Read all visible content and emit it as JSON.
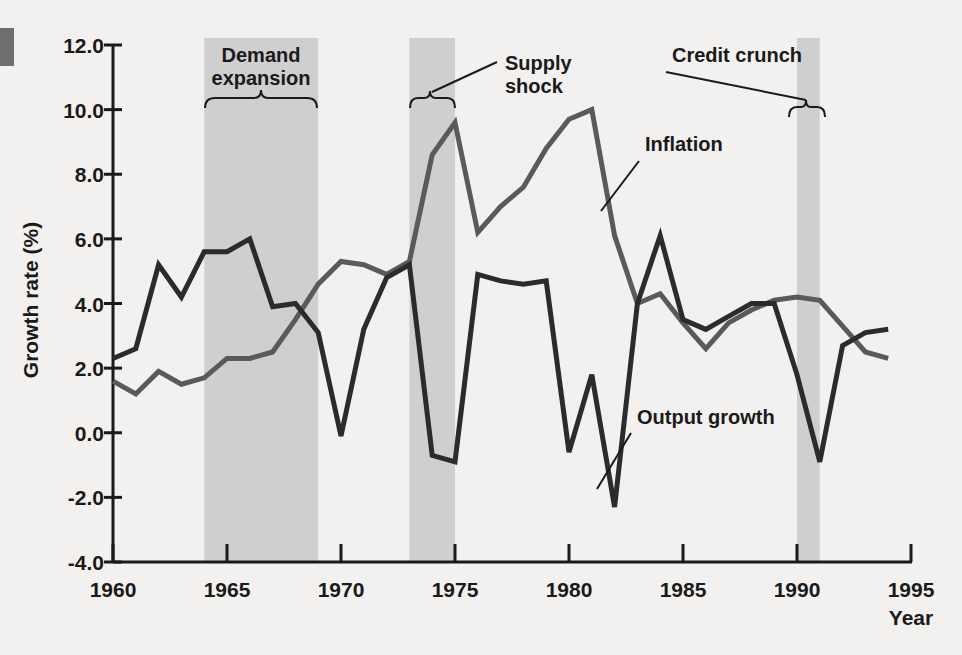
{
  "figure": {
    "margin_mark": "left-edge-bar",
    "background_color": "#f2f1ef",
    "band_color": "#cfcfcf",
    "axis_color": "#1a1a1a"
  },
  "chart_data": {
    "type": "line",
    "title": "",
    "xlabel": "Year",
    "ylabel": "Growth rate (%)",
    "xlim": [
      1960,
      1995
    ],
    "ylim": [
      -4.0,
      12.0
    ],
    "grid": false,
    "legend": "inline-annotations",
    "xticks": [
      "1960",
      "1965",
      "1970",
      "1975",
      "1980",
      "1985",
      "1990",
      "1995"
    ],
    "yticks": [
      "12.0",
      "10.0",
      "8.0",
      "6.0",
      "4.0",
      "2.0",
      "0.0",
      "-2.0",
      "-4.0"
    ],
    "x": [
      1960,
      1961,
      1962,
      1963,
      1964,
      1965,
      1966,
      1967,
      1968,
      1969,
      1970,
      1971,
      1972,
      1973,
      1974,
      1975,
      1976,
      1977,
      1978,
      1979,
      1980,
      1981,
      1982,
      1983,
      1984,
      1985,
      1986,
      1987,
      1988,
      1989,
      1990,
      1991,
      1992,
      1993,
      1994
    ],
    "series": [
      {
        "name": "Output growth",
        "color": "#2b2b2b",
        "width": 5,
        "values": [
          2.3,
          2.6,
          5.2,
          4.2,
          5.6,
          5.6,
          6.0,
          3.9,
          4.0,
          3.1,
          -0.1,
          3.2,
          4.8,
          5.2,
          -0.7,
          -0.9,
          4.9,
          4.7,
          4.6,
          4.7,
          -0.6,
          1.8,
          -2.3,
          4.0,
          6.1,
          3.5,
          3.2,
          3.6,
          4.0,
          4.0,
          1.8,
          -0.9,
          2.7,
          3.1,
          3.2
        ]
      },
      {
        "name": "Inflation",
        "color": "#5a5a5a",
        "width": 5,
        "values": [
          1.6,
          1.2,
          1.9,
          1.5,
          1.7,
          2.3,
          2.3,
          2.5,
          3.5,
          4.6,
          5.3,
          5.2,
          4.9,
          5.3,
          8.6,
          9.6,
          6.2,
          7.0,
          7.6,
          8.8,
          9.7,
          10.0,
          6.1,
          4.0,
          4.3,
          3.4,
          2.6,
          3.4,
          3.8,
          4.1,
          4.2,
          4.1,
          3.3,
          2.5,
          2.3
        ]
      }
    ],
    "annotations": [
      {
        "name": "Demand expansion",
        "label_lines": [
          "Demand",
          "expansion"
        ],
        "brace_span": [
          1964,
          1969
        ]
      },
      {
        "name": "Supply shock",
        "label_lines": [
          "Supply",
          "shock"
        ],
        "brace_span": [
          1973,
          1975
        ]
      },
      {
        "name": "Credit crunch",
        "label_lines": [
          "Credit crunch"
        ],
        "brace_span": [
          1990,
          1991
        ]
      },
      {
        "name": "Inflation",
        "label_lines": [
          "Inflation"
        ],
        "points_to": 1981
      },
      {
        "name": "Output growth",
        "label_lines": [
          "Output growth"
        ],
        "points_to": 1982
      }
    ],
    "shaded_bands": [
      {
        "name": "demand-expansion-band",
        "from": 1964,
        "to": 1969
      },
      {
        "name": "supply-shock-band",
        "from": 1973,
        "to": 1975
      },
      {
        "name": "credit-crunch-band",
        "from": 1990,
        "to": 1991
      }
    ]
  },
  "labels": {
    "ylabel": "Growth rate (%)",
    "xlabel": "Year",
    "demand_l1": "Demand",
    "demand_l2": "expansion",
    "supply_l1": "Supply",
    "supply_l2": "shock",
    "credit": "Credit crunch",
    "inflation": "Inflation",
    "output": "Output growth",
    "y12": "12.0",
    "y10": "10.0",
    "y8": "8.0",
    "y6": "6.0",
    "y4": "4.0",
    "y2": "2.0",
    "y0": "0.0",
    "ym2": "-2.0",
    "ym4": "-4.0",
    "x1960": "1960",
    "x1965": "1965",
    "x1970": "1970",
    "x1975": "1975",
    "x1980": "1980",
    "x1985": "1985",
    "x1990": "1990",
    "x1995": "1995"
  }
}
